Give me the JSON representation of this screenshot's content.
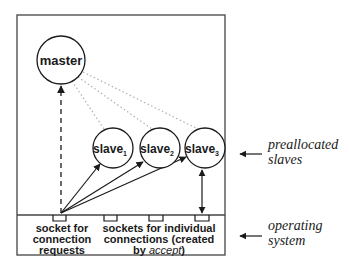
{
  "nodes": {
    "master": {
      "label": "master"
    },
    "slaves": [
      {
        "label": "slave",
        "sub": "1"
      },
      {
        "label": "slave",
        "sub": "2"
      },
      {
        "label": "slave",
        "sub": "3"
      }
    ]
  },
  "labels": {
    "socket_listen": [
      "socket for",
      "connection",
      "requests"
    ],
    "socket_individual": [
      "sockets for individual",
      "connections (created",
      "by "
    ],
    "accept": "accept",
    "close_paren": ")",
    "preallocated": [
      "preallocated",
      "slaves"
    ],
    "os": [
      "operating",
      "system"
    ]
  },
  "colors": {
    "stroke": "#1a1a1a",
    "dotted": "#b0b0b0"
  }
}
